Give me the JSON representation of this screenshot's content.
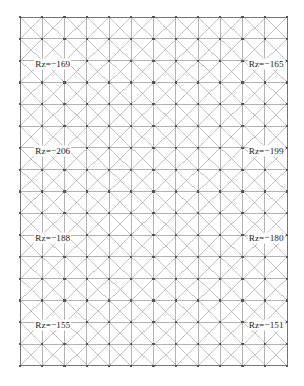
{
  "figure": {
    "title": "",
    "background_color": "#ffffff",
    "mesh_line_color": "#808080",
    "mesh_diagonal_color": "#9a9a9a",
    "node_color": "#555555",
    "label_text_color": "#1a1a1a"
  },
  "mesh": {
    "columns": 12,
    "rows": 16,
    "x0": 20,
    "y0": 17,
    "cell_width": 22.25,
    "cell_height": 21.8,
    "diagonals": "both",
    "node_marker": "square"
  },
  "labels": [
    {
      "id": "rz-top-left",
      "text": "Rz=−169",
      "value": -169,
      "col": 1,
      "row": 2,
      "side": "left"
    },
    {
      "id": "rz-top-right",
      "text": "Rz=−165",
      "value": -165,
      "col": 11,
      "row": 2,
      "side": "right"
    },
    {
      "id": "rz-upper-left",
      "text": "Rz=−206",
      "value": -206,
      "col": 1,
      "row": 6,
      "side": "left"
    },
    {
      "id": "rz-upper-right",
      "text": "Rz=−199",
      "value": -199,
      "col": 11,
      "row": 6,
      "side": "right"
    },
    {
      "id": "rz-lower-left",
      "text": "Rz=−188",
      "value": -188,
      "col": 1,
      "row": 10,
      "side": "left"
    },
    {
      "id": "rz-lower-right",
      "text": "Rz=−180",
      "value": -180,
      "col": 11,
      "row": 10,
      "side": "right"
    },
    {
      "id": "rz-bottom-left",
      "text": "Rz=−155",
      "value": -155,
      "col": 1,
      "row": 14,
      "side": "left"
    },
    {
      "id": "rz-bottom-right",
      "text": "Rz=−151",
      "value": -151,
      "col": 11,
      "row": 14,
      "side": "right"
    }
  ],
  "chart_data": {
    "type": "diagram",
    "grid": {
      "columns": 12,
      "rows": 16
    },
    "annotations": [
      {
        "label": "Rz=−169",
        "value": -169,
        "position": "top-left"
      },
      {
        "label": "Rz=−165",
        "value": -165,
        "position": "top-right"
      },
      {
        "label": "Rz=−206",
        "value": -206,
        "position": "upper-middle-left"
      },
      {
        "label": "Rz=−199",
        "value": -199,
        "position": "upper-middle-right"
      },
      {
        "label": "Rz=−188",
        "value": -188,
        "position": "lower-middle-left"
      },
      {
        "label": "Rz=−180",
        "value": -180,
        "position": "lower-middle-right"
      },
      {
        "label": "Rz=−155",
        "value": -155,
        "position": "bottom-left"
      },
      {
        "label": "Rz=−151",
        "value": -151,
        "position": "bottom-right"
      }
    ],
    "xlabel": "",
    "ylabel": "",
    "legend": []
  }
}
